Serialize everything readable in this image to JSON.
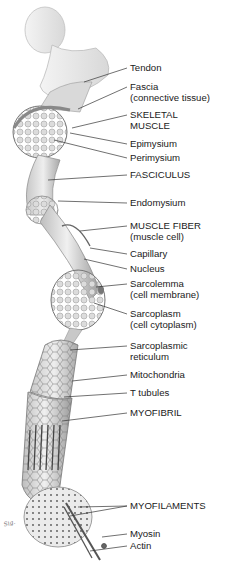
{
  "diagram": {
    "colors": {
      "line": "#333333",
      "text": "#1a1a1a",
      "tissue_light": "#e6e6e6",
      "tissue_mid": "#bdbdbd",
      "tissue_dark": "#8a8a8a"
    },
    "labels": [
      {
        "id": "tendon",
        "line1": "Tendon",
        "line2": "",
        "y": 68,
        "tx": 84,
        "ty": 82
      },
      {
        "id": "fascia",
        "line1": "Fascia",
        "line2": "(connective tissue)",
        "y": 87,
        "tx": 78,
        "ty": 109
      },
      {
        "id": "skeletal-muscle",
        "line1": "SKELETAL",
        "line2": "MUSCLE",
        "y": 115,
        "tx": 72,
        "ty": 128
      },
      {
        "id": "epimysium",
        "line1": "Epimysium",
        "line2": "",
        "y": 144,
        "tx": 70,
        "ty": 133
      },
      {
        "id": "perimysium",
        "line1": "Perimysium",
        "line2": "",
        "y": 158,
        "tx": 54,
        "ty": 140
      },
      {
        "id": "fasciculus",
        "line1": "FASCICULUS",
        "line2": "",
        "y": 175,
        "tx": 48,
        "ty": 180
      },
      {
        "id": "endomysium",
        "line1": "Endomysium",
        "line2": "",
        "y": 203,
        "tx": 58,
        "ty": 201
      },
      {
        "id": "muscle-fiber",
        "line1": "MUSCLE FIBER",
        "line2": "(muscle cell)",
        "y": 226,
        "tx": 80,
        "ty": 231
      },
      {
        "id": "capillary",
        "line1": "Capillary",
        "line2": "",
        "y": 254,
        "tx": 90,
        "ty": 248
      },
      {
        "id": "nucleus",
        "line1": "Nucleus",
        "line2": "",
        "y": 269,
        "tx": 84,
        "ty": 259
      },
      {
        "id": "sarcolemma",
        "line1": "Sarcolemma",
        "line2": "(cell membrane)",
        "y": 284,
        "tx": 96,
        "ty": 287
      },
      {
        "id": "sarcoplasm",
        "line1": "Sarcoplasm",
        "line2": "(cell cytoplasm)",
        "y": 314,
        "tx": 94,
        "ty": 303
      },
      {
        "id": "sarcoplasmic-reticulum",
        "line1": "Sarcoplasmic",
        "line2": "reticulum",
        "y": 346,
        "tx": 70,
        "ty": 350
      },
      {
        "id": "mitochondria",
        "line1": "Mitochondria",
        "line2": "",
        "y": 375,
        "tx": 72,
        "ty": 381
      },
      {
        "id": "t-tubules",
        "line1": "T tubules",
        "line2": "",
        "y": 393,
        "tx": 64,
        "ty": 397
      },
      {
        "id": "myofibril",
        "line1": "MYOFIBRIL",
        "line2": "",
        "y": 413,
        "tx": 62,
        "ty": 421
      },
      {
        "id": "myofilaments",
        "line1": "MYOFILAMENTS",
        "line2": "",
        "y": 506,
        "tx": 70,
        "ty": 516
      },
      {
        "id": "myosin",
        "line1": "Myosin",
        "line2": "",
        "y": 534,
        "tx": 102,
        "ty": 537
      },
      {
        "id": "actin",
        "line1": "Actin",
        "line2": "",
        "y": 546,
        "tx": 90,
        "ty": 551
      }
    ],
    "artist_signature": "signature"
  }
}
